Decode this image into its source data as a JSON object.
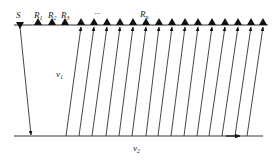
{
  "diagram": {
    "labels": {
      "source": "S",
      "r1": "R",
      "r1_sub": "1",
      "r2": "R",
      "r2_sub": "2",
      "r3": "R",
      "r3_sub": "3",
      "ellipsis": "···",
      "rn": "R",
      "rn_sub": "n",
      "v1": "v",
      "v1_sub": "1",
      "v2": "v",
      "v2_sub": "2"
    },
    "colors": {
      "line": "#333333",
      "marker": "#111111"
    },
    "surface_y": 25,
    "refractor_y": 136,
    "source_x": 20,
    "receivers_x": [
      38,
      52,
      65,
      81,
      94,
      107,
      120,
      133,
      146,
      159,
      172,
      185,
      198,
      212,
      225,
      238,
      251,
      263
    ],
    "upgoing_rays": [
      {
        "bottom_x": 66,
        "top_x": 81
      },
      {
        "bottom_x": 79,
        "top_x": 94
      },
      {
        "bottom_x": 92,
        "top_x": 107
      },
      {
        "bottom_x": 106,
        "top_x": 120
      },
      {
        "bottom_x": 119,
        "top_x": 133
      },
      {
        "bottom_x": 132,
        "top_x": 146
      },
      {
        "bottom_x": 146,
        "top_x": 159
      },
      {
        "bottom_x": 158,
        "top_x": 172
      },
      {
        "bottom_x": 171,
        "top_x": 185
      },
      {
        "bottom_x": 184,
        "top_x": 198
      },
      {
        "bottom_x": 197,
        "top_x": 212
      },
      {
        "bottom_x": 209,
        "top_x": 225
      },
      {
        "bottom_x": 222,
        "top_x": 238
      },
      {
        "bottom_x": 235,
        "top_x": 251
      },
      {
        "bottom_x": 247,
        "top_x": 263
      }
    ]
  }
}
